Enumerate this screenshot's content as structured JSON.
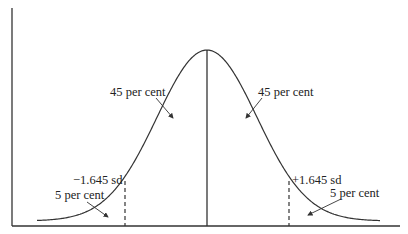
{
  "diagram": {
    "type": "normal-distribution",
    "labels": {
      "left_center_area": "45 per cent",
      "right_center_area": "45 per cent",
      "left_cutoff": "−1.645 sd",
      "right_cutoff": "+1.645 sd",
      "left_tail_area": "5 per cent",
      "right_tail_area": "5 per cent"
    },
    "colors": {
      "line": "#333333",
      "text": "#222222",
      "background": "#ffffff"
    }
  }
}
